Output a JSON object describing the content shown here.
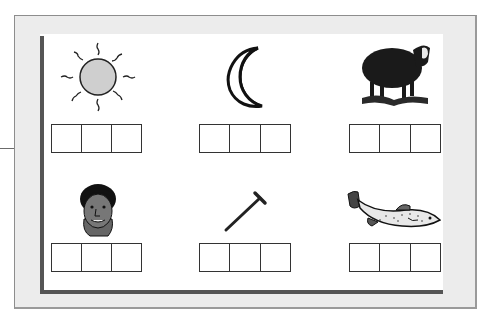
{
  "worksheet": {
    "items": [
      {
        "picture": "sun-icon",
        "letter_boxes": 3,
        "letters": [
          "",
          "",
          ""
        ]
      },
      {
        "picture": "moon-icon",
        "letter_boxes": 3,
        "letters": [
          "",
          "",
          ""
        ]
      },
      {
        "picture": "sheep-icon",
        "letter_boxes": 3,
        "letters": [
          "",
          "",
          ""
        ]
      },
      {
        "picture": "man-face-icon",
        "letter_boxes": 3,
        "letters": [
          "",
          "",
          ""
        ]
      },
      {
        "picture": "nail-icon",
        "letter_boxes": 3,
        "letters": [
          "",
          "",
          ""
        ]
      },
      {
        "picture": "fish-icon",
        "letter_boxes": 3,
        "letters": [
          "",
          "",
          ""
        ]
      }
    ]
  },
  "colors": {
    "frame": "#ececec",
    "frame_border": "#8d8d8d",
    "panel": "#ffffff",
    "panel_shadow": "#555555",
    "sun_fill": "#cfcfcf"
  }
}
